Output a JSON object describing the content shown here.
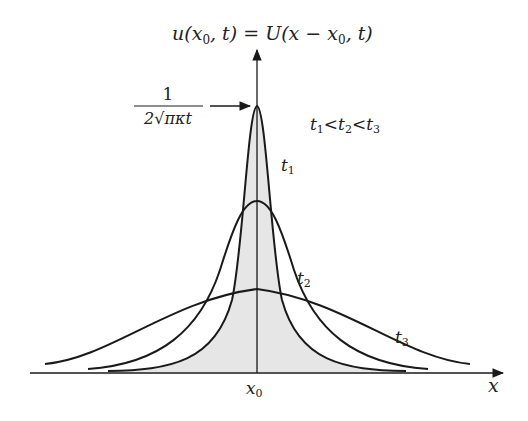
{
  "title_parts": {
    "lhs": "u(x",
    "sub0": "0",
    "mid": ", t) = U(x − x",
    "sub1": "0",
    "rhs": ", t)"
  },
  "peak_label": {
    "numerator": "1",
    "denominator": "2√πκt"
  },
  "ordering": {
    "text": "t₁ < t₂ < t₃",
    "a": "t",
    "a_sub": "1",
    "b": "t",
    "b_sub": "2",
    "c": "t",
    "c_sub": "3",
    "lt": "<"
  },
  "curves": [
    {
      "name": "t1",
      "label": "t",
      "sub": "1",
      "peak_y": 106,
      "shaded": true
    },
    {
      "name": "t2",
      "label": "t",
      "sub": "2",
      "peak_y": 201,
      "shaded": false
    },
    {
      "name": "t3",
      "label": "t",
      "sub": "3",
      "peak_y": 289,
      "shaded": false
    }
  ],
  "axes": {
    "x_label": "x",
    "x0_label": "x",
    "x0_sub": "0"
  },
  "colors": {
    "stroke": "#1a1a1a",
    "fill": "#e6e6e6",
    "text": "#222222"
  }
}
